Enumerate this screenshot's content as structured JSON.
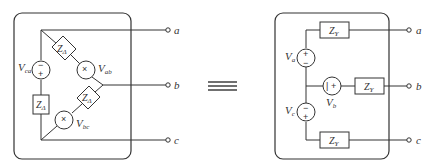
{
  "diagram": {
    "type": "delta-to-wye equivalence",
    "equivalence_symbol": "≡",
    "terminals": [
      "a",
      "b",
      "c"
    ],
    "delta": {
      "impedance_label": "Z",
      "impedance_sub": "Δ",
      "sources": [
        {
          "name": "V",
          "sub": "ca"
        },
        {
          "name": "V",
          "sub": "ab"
        },
        {
          "name": "V",
          "sub": "bc"
        }
      ]
    },
    "wye": {
      "impedance_label": "Z",
      "impedance_sub": "Y",
      "sources": [
        {
          "name": "V",
          "sub": "a"
        },
        {
          "name": "V",
          "sub": "b"
        },
        {
          "name": "V",
          "sub": "c"
        }
      ]
    },
    "signs": {
      "plus": "+",
      "minus": "−"
    }
  }
}
